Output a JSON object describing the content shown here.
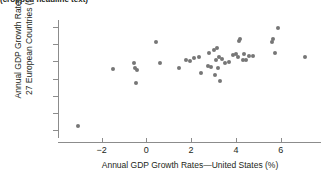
{
  "top_caption": "(cropped headline text)",
  "chart_data": {
    "type": "scatter",
    "title": "",
    "xlabel": "Annual GDP Growth Rates—United States (%)",
    "ylabel_line1": "Annual GDP Growth Rates—",
    "ylabel_line2": "27 European Countries (%)",
    "xlim": [
      -3.9,
      7.8
    ],
    "ylim": [
      -6.8,
      6.8
    ],
    "xticks": [
      -2,
      0,
      2,
      4,
      6
    ],
    "xtick_labels": [
      "−2",
      "0",
      "2",
      "4",
      "6"
    ],
    "yticks": [
      6,
      4,
      2,
      0,
      -2,
      -4,
      -6
    ],
    "ytick_labels": [
      "6",
      "4",
      "2",
      "0",
      "−2",
      "−4",
      "−6"
    ],
    "grid": false,
    "legend": "none",
    "marker_color": "#767676",
    "axis_color": "#8c8c8c",
    "points": [
      [
        -3.05,
        -5.5
      ],
      [
        -1.5,
        1.05
      ],
      [
        -0.55,
        1.8
      ],
      [
        -0.5,
        1.2
      ],
      [
        -0.4,
        0.95
      ],
      [
        -0.45,
        -0.5
      ],
      [
        0.45,
        4.3
      ],
      [
        0.6,
        1.85
      ],
      [
        1.45,
        1.25
      ],
      [
        1.75,
        2.2
      ],
      [
        1.95,
        2.0
      ],
      [
        2.15,
        2.4
      ],
      [
        2.35,
        2.5
      ],
      [
        2.45,
        0.6
      ],
      [
        2.75,
        1.5
      ],
      [
        2.8,
        3.0
      ],
      [
        2.9,
        1.35
      ],
      [
        3.0,
        3.35
      ],
      [
        3.05,
        0.35
      ],
      [
        3.1,
        2.1
      ],
      [
        3.15,
        3.6
      ],
      [
        3.2,
        1.2
      ],
      [
        3.25,
        2.55
      ],
      [
        3.3,
        -0.25
      ],
      [
        3.4,
        2.25
      ],
      [
        3.5,
        1.85
      ],
      [
        3.7,
        1.95
      ],
      [
        3.85,
        2.75
      ],
      [
        4.0,
        2.85
      ],
      [
        4.1,
        2.45
      ],
      [
        4.15,
        4.35
      ],
      [
        4.2,
        4.6
      ],
      [
        4.3,
        2.1
      ],
      [
        4.35,
        2.9
      ],
      [
        4.45,
        2.15
      ],
      [
        4.6,
        2.65
      ],
      [
        4.75,
        2.6
      ],
      [
        5.6,
        4.2
      ],
      [
        5.65,
        4.55
      ],
      [
        5.75,
        2.95
      ],
      [
        5.9,
        5.85
      ],
      [
        7.1,
        2.5
      ]
    ]
  }
}
